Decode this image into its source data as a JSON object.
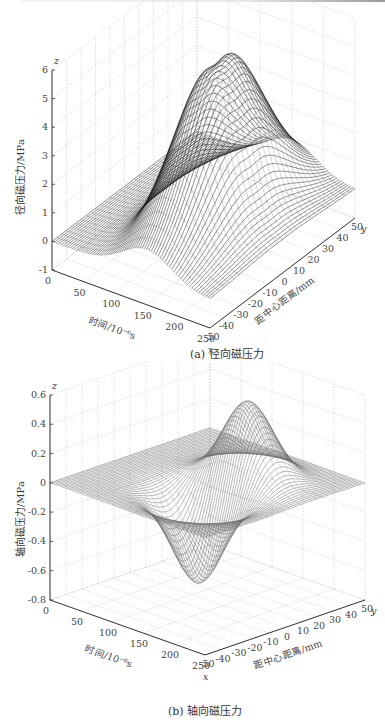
{
  "figure": {
    "panels": [
      {
        "id": "a",
        "caption": "(a) 径向磁压力",
        "zlabel": "径向磁压力/MPa",
        "xlabel": "时间/10⁻⁶s",
        "ylabel": "距中心距离/mm"
      },
      {
        "id": "b",
        "caption": "(b) 轴向磁压力",
        "zlabel": "轴向磁压力/MPa",
        "xlabel": "时间/10⁻⁶s",
        "ylabel": "距中心距离/mm"
      }
    ]
  },
  "chart_data": [
    {
      "type": "surface",
      "title": "(a) 径向磁压力",
      "xlabel": "时间/10⁻⁶s",
      "ylabel": "距中心距离/mm",
      "zlabel": "径向磁压力/MPa",
      "axis_letters": {
        "x": "x",
        "y": "y",
        "z": "z"
      },
      "xlim": [
        0,
        250
      ],
      "ylim": [
        -50,
        50
      ],
      "zlim": [
        -1,
        6
      ],
      "x_ticks": [
        0,
        50,
        100,
        150,
        200,
        250
      ],
      "y_ticks": [
        -50,
        -40,
        -30,
        -20,
        -10,
        0,
        10,
        20,
        30,
        40,
        50
      ],
      "z_ticks": [
        -1,
        0,
        1,
        2,
        3,
        4,
        5,
        6
      ],
      "grid": true,
      "description": "Single broad positive peak centered near x≈150 (time), y≈0 (center), peak ≈6 MPa; surface ~0 elsewhere with slight ripples near edges",
      "peak": {
        "x": 150,
        "y": 0,
        "z": 6.0
      },
      "baseline": 0
    },
    {
      "type": "surface",
      "title": "(b) 轴向磁压力",
      "xlabel": "时间/10⁻⁶s",
      "ylabel": "距中心距离/mm",
      "zlabel": "轴向磁压力/MPa",
      "axis_letters": {
        "x": "x",
        "y": "y",
        "z": "z"
      },
      "xlim": [
        0,
        250
      ],
      "ylim": [
        -50,
        50
      ],
      "zlim": [
        -0.8,
        0.6
      ],
      "x_ticks": [
        0,
        50,
        100,
        150,
        200,
        250
      ],
      "y_ticks": [
        -50,
        -40,
        -30,
        -20,
        -10,
        0,
        10,
        20,
        30,
        40,
        50
      ],
      "z_ticks": [
        -0.8,
        -0.6,
        -0.4,
        -0.2,
        0,
        0.2,
        0.4,
        0.6
      ],
      "grid": true,
      "description": "Antisymmetric in y: positive peak ≈0.55 MPa near y≈+15 mm and negative trough ≈-0.6 MPa near y≈-15 mm, both at x≈150",
      "peak": {
        "x": 150,
        "y": 15,
        "z": 0.55
      },
      "trough": {
        "x": 150,
        "y": -15,
        "z": -0.6
      },
      "baseline": 0
    }
  ]
}
